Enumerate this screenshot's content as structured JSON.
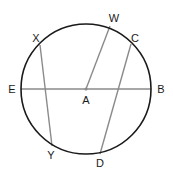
{
  "diagram": {
    "type": "circle-geometry",
    "center": {
      "label": "A",
      "x": 86,
      "y": 89
    },
    "radius": 65,
    "colors": {
      "circle": "#1a1a1a",
      "segment": "#8a8a8a",
      "label": "#1a1a1a",
      "background": "#ffffff"
    },
    "points": {
      "A": {
        "label": "A",
        "x": 86,
        "y": 89,
        "lx": 86,
        "ly": 104
      },
      "B": {
        "label": "B",
        "x": 151,
        "y": 89,
        "lx": 161,
        "ly": 93
      },
      "E": {
        "label": "E",
        "x": 21,
        "y": 89,
        "lx": 12,
        "ly": 93
      },
      "W": {
        "label": "W",
        "x": 110,
        "y": 26,
        "lx": 114,
        "ly": 22
      },
      "C": {
        "label": "C",
        "x": 131,
        "y": 44,
        "lx": 135,
        "ly": 42
      },
      "X": {
        "label": "X",
        "x": 40,
        "y": 45,
        "lx": 36,
        "ly": 42
      },
      "Y": {
        "label": "Y",
        "x": 52,
        "y": 146,
        "lx": 51,
        "ly": 159
      },
      "D": {
        "label": "D",
        "x": 100,
        "y": 154,
        "lx": 100,
        "ly": 167
      }
    },
    "segments": [
      {
        "from": "E",
        "to": "B",
        "kind": "diameter"
      },
      {
        "from": "A",
        "to": "W",
        "kind": "radius"
      },
      {
        "from": "X",
        "to": "Y",
        "kind": "chord"
      },
      {
        "from": "C",
        "to": "D",
        "kind": "chord"
      }
    ]
  }
}
